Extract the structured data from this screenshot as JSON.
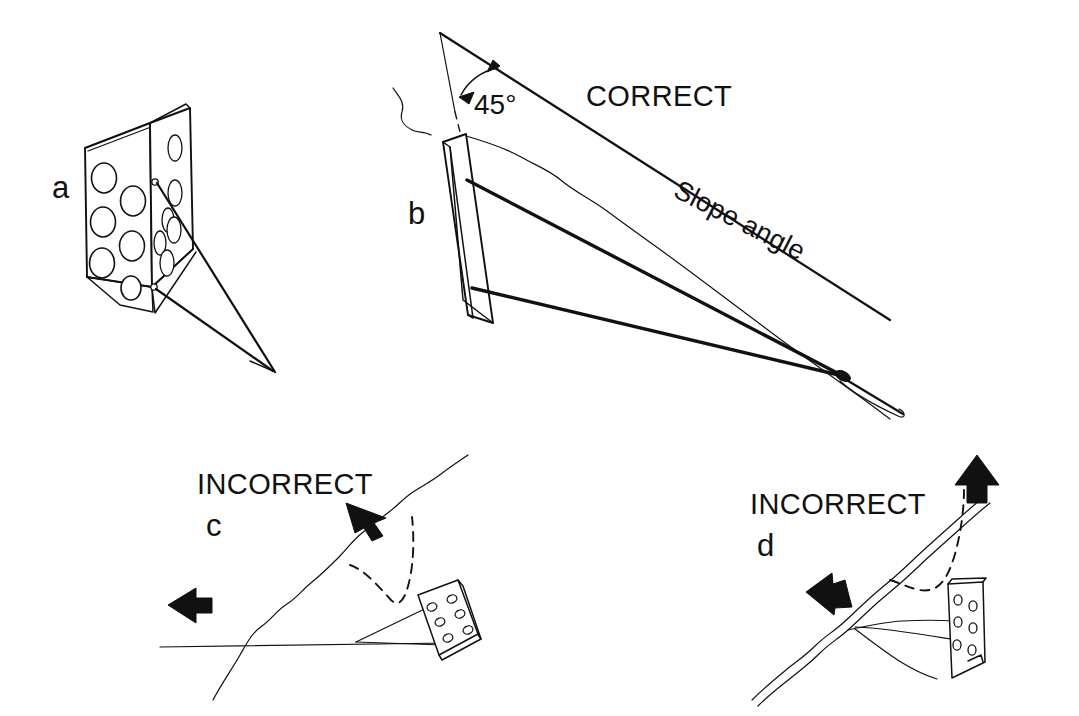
{
  "figure": {
    "background_color": "#ffffff",
    "ink_color": "#111111",
    "panels": [
      {
        "id": "a",
        "label": "a",
        "label_x": 52,
        "label_y": 198,
        "caption": "",
        "description": "Perforated anchor plate pair shown in three-quarter view with cables"
      },
      {
        "id": "b",
        "label": "b",
        "label_x": 408,
        "label_y": 224,
        "caption": "CORRECT",
        "caption_x": 586,
        "caption_y": 106,
        "annotations": [
          {
            "name": "angle-label",
            "text": "45°",
            "x": 474,
            "y": 114
          },
          {
            "name": "slope-angle-label",
            "text": "Slope angle",
            "x": 672,
            "y": 196,
            "rotation_deg": 27
          }
        ],
        "description": "Anchor plate installed perpendicular, cable bisecting the 45 degree angle to the slope"
      },
      {
        "id": "c",
        "label": "c",
        "label_x": 206,
        "label_y": 536,
        "caption": "INCORRECT",
        "caption_x": 197,
        "caption_y": 494,
        "description": "Anchor plate laid too flat relative to the slope failure surface"
      },
      {
        "id": "d",
        "label": "d",
        "label_x": 757,
        "label_y": 556,
        "caption": "INCORRECT",
        "caption_x": 750,
        "caption_y": 514,
        "description": "Anchor plate set too upright relative to the slope failure surface"
      }
    ],
    "legend_terms": {
      "correct": "CORRECT",
      "incorrect": "INCORRECT",
      "angle": "45°",
      "slope": "Slope angle"
    }
  }
}
